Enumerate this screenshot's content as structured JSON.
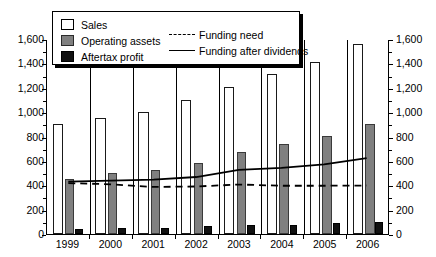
{
  "chart_data": {
    "type": "bar",
    "title": "",
    "xlabel": "",
    "ylabel": "",
    "ylim": [
      0,
      1600
    ],
    "ytick_step": 200,
    "grid": false,
    "legend_position": "top-left",
    "dual_axis": true,
    "categories": [
      "1999",
      "2000",
      "2001",
      "2002",
      "2003",
      "2004",
      "2005",
      "2006"
    ],
    "ytick_labels": [
      "0",
      "200",
      "400",
      "600",
      "800",
      "1,000",
      "1,200",
      "1,400",
      "1,600"
    ],
    "ytick_values": [
      0,
      200,
      400,
      600,
      800,
      1000,
      1200,
      1400,
      1600
    ],
    "series": [
      {
        "name": "Sales",
        "kind": "bar",
        "color": "#ffffff",
        "values": [
          900,
          950,
          1000,
          1100,
          1205,
          1310,
          1410,
          1560
        ]
      },
      {
        "name": "Operating assets",
        "kind": "bar",
        "color": "#808080",
        "values": [
          450,
          500,
          525,
          580,
          675,
          735,
          805,
          900
        ]
      },
      {
        "name": "Aftertax profit",
        "kind": "bar",
        "color": "#111111",
        "values": [
          40,
          48,
          52,
          62,
          72,
          78,
          88,
          100
        ]
      },
      {
        "name": "Funding need",
        "kind": "line",
        "style": "dashed",
        "color": "#000000",
        "values": [
          420,
          410,
          388,
          392,
          408,
          398,
          398,
          400
        ]
      },
      {
        "name": "Funding after dividends",
        "kind": "line",
        "style": "solid",
        "color": "#000000",
        "values": [
          432,
          440,
          448,
          470,
          528,
          545,
          575,
          625
        ]
      }
    ]
  },
  "legend": {
    "items": [
      {
        "label": "Sales",
        "swatch": "white-square"
      },
      {
        "label": "Operating assets",
        "swatch": "gray-square"
      },
      {
        "label": "Aftertax profit",
        "swatch": "black-square"
      },
      {
        "label": "Funding need",
        "swatch": "dashed-line"
      },
      {
        "label": "Funding after dividends",
        "swatch": "solid-line"
      }
    ]
  }
}
